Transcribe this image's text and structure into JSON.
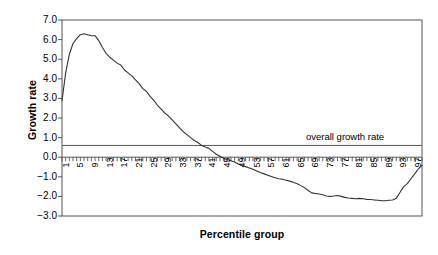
{
  "chart_data": {
    "type": "line",
    "title": "",
    "subtitle": "",
    "xlabel": "Percentile group",
    "ylabel": "Growth rate",
    "xlim": [
      1,
      99
    ],
    "ylim": [
      -3.0,
      7.0
    ],
    "grid": false,
    "legend": null,
    "y_ticks": [
      "7.0",
      "6.0",
      "5.0",
      "4.0",
      "3.0",
      "2.0",
      "1.0",
      "0.0",
      "−1.0",
      "−2.0",
      "−3.0"
    ],
    "y_tick_values": [
      7.0,
      6.0,
      5.0,
      4.0,
      3.0,
      2.0,
      1.0,
      0.0,
      -1.0,
      -2.0,
      -3.0
    ],
    "x_ticks": [
      "1",
      "5",
      "9",
      "13",
      "17",
      "21",
      "25",
      "29",
      "33",
      "37",
      "41",
      "45",
      "49",
      "53",
      "57",
      "61",
      "65",
      "69",
      "73",
      "77",
      "81",
      "85",
      "89",
      "93",
      "97"
    ],
    "x_tick_values": [
      1,
      5,
      9,
      13,
      17,
      21,
      25,
      29,
      33,
      37,
      41,
      45,
      49,
      53,
      57,
      61,
      65,
      69,
      73,
      77,
      81,
      85,
      89,
      93,
      97
    ],
    "x_minor_tick_step": 1,
    "annotations": [
      {
        "name": "overall-growth-rate-line",
        "label": "overall growth rate",
        "type": "hline",
        "y": 0.6
      }
    ],
    "series": [
      {
        "name": "growth rate by percentile group",
        "color": "#333333",
        "x": [
          1,
          2,
          3,
          4,
          5,
          6,
          7,
          8,
          9,
          10,
          11,
          12,
          13,
          14,
          15,
          16,
          17,
          18,
          19,
          20,
          21,
          22,
          23,
          24,
          25,
          26,
          27,
          28,
          29,
          30,
          31,
          32,
          33,
          34,
          35,
          36,
          37,
          38,
          39,
          40,
          41,
          42,
          43,
          44,
          45,
          46,
          47,
          48,
          49,
          50,
          51,
          52,
          53,
          54,
          55,
          56,
          57,
          58,
          59,
          60,
          61,
          62,
          63,
          64,
          65,
          66,
          67,
          68,
          69,
          70,
          71,
          72,
          73,
          74,
          75,
          76,
          77,
          78,
          79,
          80,
          81,
          82,
          83,
          84,
          85,
          86,
          87,
          88,
          89,
          90,
          91,
          92,
          93,
          94,
          95,
          96,
          97,
          98,
          99
        ],
        "values": [
          2.9,
          4.3,
          5.25,
          5.8,
          6.05,
          6.25,
          6.3,
          6.25,
          6.2,
          6.2,
          5.95,
          5.6,
          5.3,
          5.1,
          4.95,
          4.8,
          4.7,
          4.45,
          4.3,
          4.15,
          3.95,
          3.75,
          3.5,
          3.35,
          3.1,
          2.9,
          2.65,
          2.45,
          2.25,
          2.1,
          1.9,
          1.7,
          1.5,
          1.3,
          1.15,
          1.0,
          0.85,
          0.75,
          0.6,
          0.52,
          0.45,
          0.3,
          0.15,
          0.05,
          -0.05,
          -0.12,
          -0.18,
          -0.25,
          -0.35,
          -0.42,
          -0.48,
          -0.55,
          -0.62,
          -0.7,
          -0.78,
          -0.85,
          -0.92,
          -0.98,
          -1.05,
          -1.1,
          -1.12,
          -1.18,
          -1.22,
          -1.28,
          -1.35,
          -1.45,
          -1.55,
          -1.7,
          -1.82,
          -1.85,
          -1.88,
          -1.92,
          -1.98,
          -2.0,
          -1.98,
          -1.95,
          -2.0,
          -2.05,
          -2.08,
          -2.1,
          -2.12,
          -2.1,
          -2.12,
          -2.15,
          -2.16,
          -2.18,
          -2.2,
          -2.22,
          -2.22,
          -2.2,
          -2.18,
          -2.1,
          -1.8,
          -1.5,
          -1.35,
          -1.1,
          -0.85,
          -0.6,
          -0.42
        ]
      }
    ]
  },
  "axis": {
    "y_title": "Growth rate",
    "x_title": "Percentile group"
  },
  "colors": {
    "line": "#333333",
    "axis": "#555555",
    "reference_line": "#555555",
    "background": "#ffffff",
    "text": "#000000"
  }
}
